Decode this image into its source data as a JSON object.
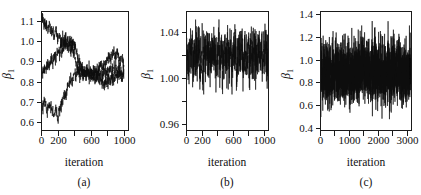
{
  "figure": {
    "background_color": "#ffffff",
    "ink_color": "#111111",
    "panel_count": 3
  },
  "chart_data": [
    {
      "type": "line",
      "panel_id": "a",
      "caption": "(a)",
      "title": "",
      "xlabel": "iteration",
      "ylabel": "β",
      "ylabel_subscript": "1",
      "xlim": [
        0,
        1050
      ],
      "ylim": [
        0.56,
        1.15
      ],
      "xticks": [
        0,
        200,
        400,
        600,
        800,
        1000
      ],
      "xtick_labels": [
        "0",
        "200",
        "",
        "600",
        "",
        "1000"
      ],
      "yticks": [
        0.6,
        0.7,
        0.8,
        0.9,
        1.0,
        1.1
      ],
      "ytick_labels": [
        "0.6",
        "0.7",
        "0.8",
        "0.9",
        "1.0",
        "1.1"
      ],
      "grid": false,
      "legend": "none",
      "description": "Three MCMC chains started from dispersed values converging toward 0.85-0.95",
      "series": [
        {
          "name": "chain-1",
          "x": [
            0,
            20,
            40,
            60,
            80,
            100,
            120,
            140,
            160,
            180,
            200,
            220,
            240,
            260,
            280,
            300,
            320,
            340,
            360,
            380,
            400,
            420,
            440,
            460,
            480,
            500,
            520,
            540,
            560,
            580,
            600,
            620,
            640,
            660,
            680,
            700,
            720,
            740,
            760,
            780,
            800,
            820,
            840,
            860,
            880,
            900,
            920,
            940,
            960,
            980,
            1000
          ],
          "values": [
            1.1,
            1.12,
            1.08,
            1.1,
            1.06,
            1.09,
            1.04,
            1.07,
            1.02,
            1.05,
            1.01,
            1.03,
            0.99,
            1.02,
            0.98,
            1.0,
            0.96,
            0.99,
            0.95,
            0.97,
            0.93,
            0.9,
            0.87,
            0.85,
            0.88,
            0.84,
            0.86,
            0.83,
            0.85,
            0.82,
            0.84,
            0.81,
            0.84,
            0.86,
            0.83,
            0.86,
            0.89,
            0.87,
            0.9,
            0.88,
            0.91,
            0.93,
            0.9,
            0.93,
            0.95,
            0.92,
            0.94,
            0.91,
            0.89,
            0.92,
            0.88
          ]
        },
        {
          "name": "chain-2",
          "x": [
            0,
            20,
            40,
            60,
            80,
            100,
            120,
            140,
            160,
            180,
            200,
            220,
            240,
            260,
            280,
            300,
            320,
            340,
            360,
            380,
            400,
            420,
            440,
            460,
            480,
            500,
            520,
            540,
            560,
            580,
            600,
            620,
            640,
            660,
            680,
            700,
            720,
            740,
            760,
            780,
            800,
            820,
            840,
            860,
            880,
            900,
            920,
            940,
            960,
            980,
            1000
          ],
          "values": [
            0.86,
            0.83,
            0.87,
            0.85,
            0.89,
            0.87,
            0.91,
            0.89,
            0.93,
            0.92,
            0.95,
            0.94,
            0.97,
            0.96,
            0.99,
            0.98,
            1.0,
            0.99,
            1.01,
            1.0,
            0.99,
            0.96,
            0.93,
            0.9,
            0.88,
            0.86,
            0.84,
            0.83,
            0.85,
            0.83,
            0.86,
            0.84,
            0.82,
            0.8,
            0.83,
            0.81,
            0.84,
            0.82,
            0.85,
            0.83,
            0.86,
            0.84,
            0.87,
            0.85,
            0.88,
            0.86,
            0.84,
            0.87,
            0.85,
            0.83,
            0.86
          ]
        },
        {
          "name": "chain-3",
          "x": [
            0,
            20,
            40,
            60,
            80,
            100,
            120,
            140,
            160,
            180,
            200,
            220,
            240,
            260,
            280,
            300,
            320,
            340,
            360,
            380,
            400,
            420,
            440,
            460,
            480,
            500,
            520,
            540,
            560,
            580,
            600,
            620,
            640,
            660,
            680,
            700,
            720,
            740,
            760,
            780,
            800,
            820,
            840,
            860,
            880,
            900,
            920,
            940,
            960,
            980,
            1000
          ],
          "values": [
            0.69,
            0.67,
            0.7,
            0.68,
            0.66,
            0.69,
            0.67,
            0.65,
            0.63,
            0.66,
            0.62,
            0.65,
            0.68,
            0.71,
            0.74,
            0.72,
            0.76,
            0.79,
            0.82,
            0.8,
            0.84,
            0.83,
            0.86,
            0.84,
            0.82,
            0.85,
            0.83,
            0.86,
            0.84,
            0.87,
            0.85,
            0.83,
            0.86,
            0.84,
            0.87,
            0.85,
            0.82,
            0.8,
            0.78,
            0.81,
            0.79,
            0.82,
            0.8,
            0.83,
            0.81,
            0.84,
            0.82,
            0.85,
            0.83,
            0.81,
            0.84
          ]
        }
      ]
    },
    {
      "type": "line",
      "panel_id": "b",
      "caption": "(b)",
      "title": "",
      "xlabel": "iteration",
      "ylabel": "β",
      "ylabel_subscript": "1",
      "xlim": [
        0,
        1050
      ],
      "ylim": [
        0.955,
        1.058
      ],
      "xticks": [
        0,
        200,
        400,
        600,
        800,
        1000
      ],
      "xtick_labels": [
        "0",
        "200",
        "",
        "600",
        "",
        "1000"
      ],
      "yticks": [
        0.96,
        0.98,
        1.0,
        1.02,
        1.04,
        1.06
      ],
      "ytick_labels": [
        "0.96",
        "",
        "1.00",
        "",
        "1.04",
        ""
      ],
      "grid": false,
      "legend": "none",
      "description": "Dense well-mixed stationary trace centred near 1.02 with range about 0.97 to 1.05",
      "series": [
        {
          "name": "chain-1",
          "center": 1.019,
          "sd": 0.012,
          "n": 1000,
          "ymin": 0.966,
          "ymax": 1.052
        }
      ]
    },
    {
      "type": "line",
      "panel_id": "c",
      "caption": "(c)",
      "title": "",
      "xlabel": "iteration",
      "ylabel": "β",
      "ylabel_subscript": "1",
      "xlim": [
        0,
        3150
      ],
      "ylim": [
        0.38,
        1.43
      ],
      "xticks": [
        0,
        500,
        1000,
        1500,
        2000,
        2500,
        3000
      ],
      "xtick_labels": [
        "0",
        "",
        "1000",
        "",
        "2000",
        "",
        "3000"
      ],
      "yticks": [
        0.4,
        0.6,
        0.8,
        1.0,
        1.2,
        1.4
      ],
      "ytick_labels": [
        "0.4",
        "0.6",
        "0.8",
        "1.0",
        "1.2",
        "1.4"
      ],
      "grid": false,
      "legend": "none",
      "description": "Dense stationary trace centred near 0.90 with range about 0.45 to 1.37",
      "series": [
        {
          "name": "chain-1",
          "center": 0.895,
          "sd": 0.135,
          "n": 3000,
          "ymin": 0.45,
          "ymax": 1.37
        }
      ]
    }
  ]
}
